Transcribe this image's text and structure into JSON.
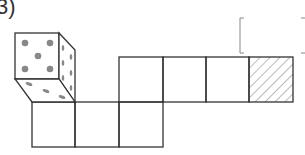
{
  "problem": {
    "number_label": "3)",
    "answer_bracket": "[          ]"
  },
  "figure": {
    "type": "cube-net",
    "die_front_face_pips": 5,
    "die_side_face_pips": 6,
    "die_bottom_face_pips": 3,
    "top_row_squares": 4,
    "bottom_row_squares": 3,
    "hatched_square": "top-row-last",
    "colors": {
      "line": "#333333",
      "pip": "#888888",
      "hatch": "#777777"
    }
  }
}
